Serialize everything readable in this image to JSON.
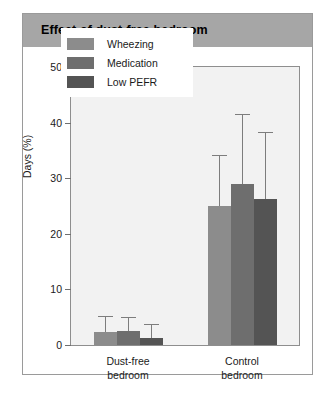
{
  "card": {
    "title": "Effect of dust-free bedroom"
  },
  "chart_data": {
    "type": "bar",
    "title": "Effect of dust-free bedroom",
    "xlabel": "",
    "ylabel": "Days (%)",
    "ylim": [
      0,
      50
    ],
    "yticks": [
      0,
      10,
      20,
      30,
      40,
      50
    ],
    "ytick_labels": [
      "0",
      "10",
      "20",
      "30",
      "40",
      "50"
    ],
    "grid": false,
    "legend_position": "upper-left-inside",
    "categories": [
      "Dust-free bedroom",
      "Control bedroom"
    ],
    "category_lines": [
      [
        "Dust-free",
        "bedroom"
      ],
      [
        "Control",
        "bedroom"
      ]
    ],
    "series": [
      {
        "name": "Wheezing",
        "color": "#8c8c8c",
        "values": [
          2.3,
          25.0
        ],
        "error_high": [
          5.0,
          34.0
        ]
      },
      {
        "name": "Medication",
        "color": "#6e6e6e",
        "values": [
          2.5,
          29.0
        ],
        "error_high": [
          4.8,
          41.3
        ]
      },
      {
        "name": "Low PEFR",
        "color": "#545454",
        "values": [
          1.2,
          26.2
        ],
        "error_high": [
          3.6,
          38.2
        ]
      }
    ]
  },
  "colors": {
    "title_bar": "#a6a6a6",
    "plot_background": "#f2f2f2",
    "card_border": "#9a9a9a",
    "axis": "#8e8e8e",
    "error_bar": "#7d7d7d"
  }
}
